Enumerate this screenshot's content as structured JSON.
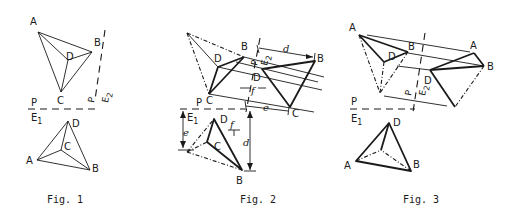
{
  "figures": [
    {
      "caption": "Fig. 1",
      "upper_view": {
        "points": {
          "A": "A",
          "B": "B",
          "C": "C",
          "D": "D"
        }
      },
      "lower_view": {
        "points": {
          "A": "A",
          "B": "B",
          "C": "C",
          "D": "D"
        }
      },
      "axis_labels": {
        "p_top": "P",
        "p_bottom": "E1",
        "side_top": "P",
        "side_bottom": "E2"
      }
    },
    {
      "caption": "Fig. 2",
      "upper_view": {
        "points": {
          "B": "B",
          "C": "C",
          "D": "D"
        }
      },
      "aux_view": {
        "points": {
          "B": "B",
          "C": "C",
          "D": "D"
        }
      },
      "lower_view": {
        "points": {
          "B": "B",
          "C": "C",
          "D": "D"
        }
      },
      "axis_labels": {
        "p_top": "P",
        "p_bottom": "E1",
        "side_top": "P",
        "side_bottom": "E2"
      },
      "dimensions": {
        "d_top": "d",
        "e_top": "e",
        "f_top": "f",
        "d_lower": "d",
        "e_lower": "e",
        "f_lower": "f"
      }
    },
    {
      "caption": "Fig. 3",
      "upper_view": {
        "points": {
          "A": "A",
          "B": "B",
          "D": "D"
        }
      },
      "aux_view": {
        "points": {
          "A": "A",
          "B": "B",
          "D": "D"
        }
      },
      "lower_view": {
        "points": {
          "A": "A",
          "B": "B",
          "D": "D"
        }
      },
      "axis_labels": {
        "p_top": "P",
        "p_bottom": "E1",
        "side_top": "P",
        "side_bottom": "E2"
      }
    }
  ]
}
